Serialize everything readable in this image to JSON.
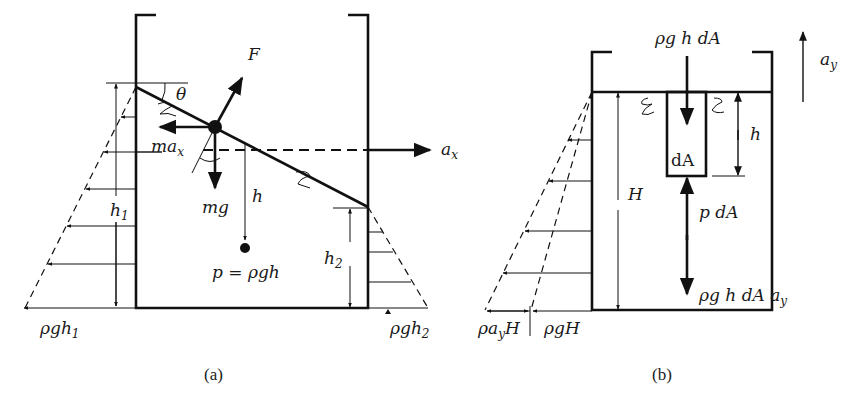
{
  "figure": {
    "panel_a": {
      "caption": "(a)",
      "labels": {
        "force": "F",
        "angle": "θ",
        "inertial_force": "ma",
        "inertial_sub": "x",
        "accel_x": "a",
        "accel_x_sub": "x",
        "weight": "mg",
        "depth": "h",
        "height_left": "h",
        "height_left_sub": "1",
        "height_right": "h",
        "height_right_sub": "2",
        "pressure_eq": "p = ρgh",
        "pressure_left": "ρgh",
        "pressure_left_sub": "1",
        "pressure_right": "ρgh",
        "pressure_right_sub": "2"
      }
    },
    "panel_b": {
      "caption": "(b)",
      "labels": {
        "top_force": "ρg h dA",
        "accel_y": "a",
        "accel_y_sub": "y",
        "depth": "h",
        "element": "dA",
        "total_height": "H",
        "pressure_force": "p dA",
        "inertia_force": "ρg h dA a",
        "inertia_force_sub": "y",
        "pressure_accel": "ρa",
        "pressure_accel_sub": "y",
        "pressure_accel_tail": "H",
        "pressure_grav": "ρgH"
      }
    }
  }
}
